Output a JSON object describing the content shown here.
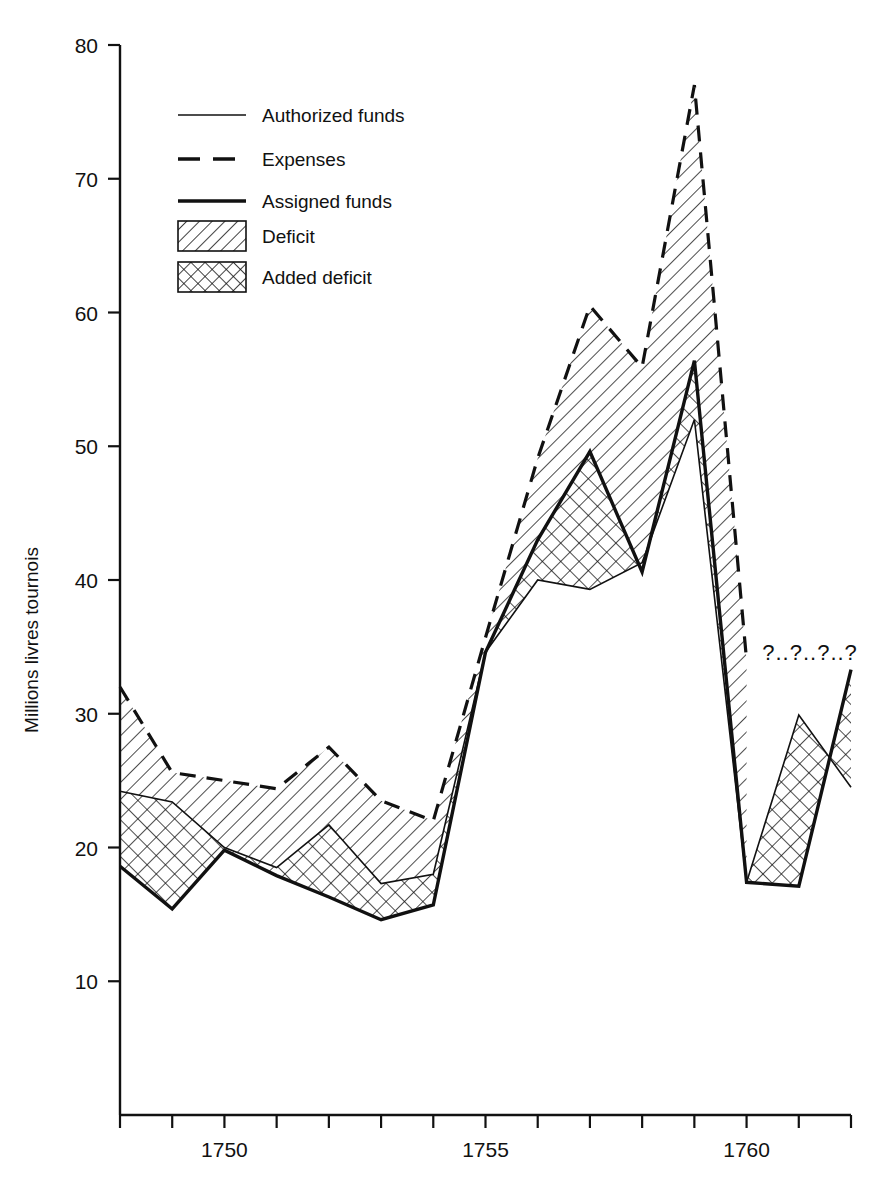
{
  "chart_data": {
    "type": "line",
    "title": "",
    "subtitle": "",
    "xlabel": "",
    "ylabel": "Millions livres tournois",
    "xlim": [
      1748,
      1762
    ],
    "ylim": [
      0,
      80
    ],
    "yticks": [
      10,
      20,
      30,
      40,
      50,
      60,
      70,
      80
    ],
    "ytick_labels": [
      "10",
      "20",
      "30",
      "40",
      "50",
      "60",
      "70",
      "80"
    ],
    "xticks": [
      1748,
      1749,
      1750,
      1751,
      1752,
      1753,
      1754,
      1755,
      1756,
      1757,
      1758,
      1759,
      1760,
      1761,
      1762
    ],
    "xtick_labels": [
      "",
      "",
      "1750",
      "",
      "",
      "",
      "",
      "1755",
      "",
      "",
      "",
      "",
      "1760",
      "",
      ""
    ],
    "grid": false,
    "legend_position": "upper-left-inside",
    "x": [
      1748,
      1749,
      1750,
      1751,
      1752,
      1753,
      1754,
      1755,
      1756,
      1757,
      1758,
      1759,
      1760,
      1761,
      1762
    ],
    "series": [
      {
        "name": "Expenses",
        "style": "dashed",
        "values": [
          32.0,
          25.6,
          25.0,
          24.4,
          27.5,
          23.5,
          22.0,
          35.7,
          49.1,
          60.5,
          55.9,
          77.0,
          34.0,
          null,
          null
        ]
      },
      {
        "name": "Authorized funds",
        "style": "thin-solid",
        "values": [
          24.2,
          23.4,
          20.0,
          18.5,
          21.7,
          17.3,
          18.0,
          34.6,
          40.0,
          39.3,
          41.3,
          52.0,
          17.4,
          29.9,
          24.5
        ]
      },
      {
        "name": "Assigned funds",
        "style": "thick-solid",
        "values": [
          18.6,
          15.4,
          19.8,
          17.9,
          16.3,
          14.6,
          15.7,
          34.6,
          43.0,
          49.6,
          40.6,
          56.4,
          17.4,
          17.1,
          33.3
        ]
      }
    ],
    "bands": [
      {
        "name": "Deficit",
        "pattern": "diagonal-hatch",
        "between": [
          "Expenses",
          "Authorized funds"
        ]
      },
      {
        "name": "Added deficit",
        "pattern": "cross-hatch",
        "between": [
          "Authorized funds",
          "Assigned funds"
        ]
      }
    ],
    "annotations": [
      {
        "text": "?..?..?..?",
        "x": 1760.3,
        "y": 34.0
      }
    ]
  },
  "legend": {
    "items": [
      {
        "label": "Authorized funds",
        "marker": "thin-line"
      },
      {
        "label": "Expenses",
        "marker": "dashed-line"
      },
      {
        "label": "Assigned funds",
        "marker": "thick-line"
      },
      {
        "label": "Deficit",
        "marker": "diagonal-hatch-swatch"
      },
      {
        "label": "Added deficit",
        "marker": "cross-hatch-swatch"
      }
    ]
  },
  "axis": {
    "y_title": "Millions livres tournois",
    "y_labels": [
      "80",
      "70",
      "60",
      "50",
      "40",
      "30",
      "20",
      "10"
    ],
    "x_labels": [
      "1750",
      "1755",
      "1760"
    ]
  },
  "colors": {
    "ink": "#111111",
    "background": "#ffffff"
  }
}
